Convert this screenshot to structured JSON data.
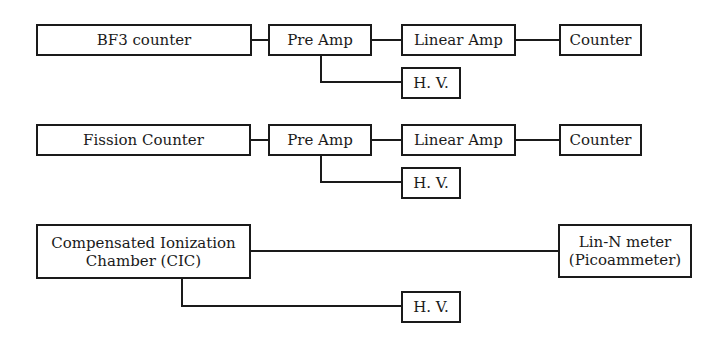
{
  "diagram": {
    "rows": [
      {
        "detector": "BF3 counter",
        "preamp": "Pre Amp",
        "linear_amp": "Linear Amp",
        "counter": "Counter",
        "hv": "H. V."
      },
      {
        "detector": "Fission Counter",
        "preamp": "Pre Amp",
        "linear_amp": "Linear Amp",
        "counter": "Counter",
        "hv": "H. V."
      },
      {
        "detector_line1": "Compensated Ionization",
        "detector_line2": "Chamber (CIC)",
        "meter_line1": "Lin-N meter",
        "meter_line2": "(Picoammeter)",
        "hv": "H. V."
      }
    ],
    "connections": [
      [
        "BF3 counter",
        "Pre Amp"
      ],
      [
        "Pre Amp",
        "Linear Amp"
      ],
      [
        "Linear Amp",
        "Counter"
      ],
      [
        "Pre Amp",
        "H. V."
      ],
      [
        "Fission Counter",
        "Pre Amp"
      ],
      [
        "Pre Amp",
        "Linear Amp"
      ],
      [
        "Linear Amp",
        "Counter"
      ],
      [
        "Pre Amp",
        "H. V."
      ],
      [
        "Compensated Ionization Chamber (CIC)",
        "Lin-N meter (Picoammeter)"
      ],
      [
        "Compensated Ionization Chamber (CIC)",
        "H. V."
      ]
    ]
  }
}
